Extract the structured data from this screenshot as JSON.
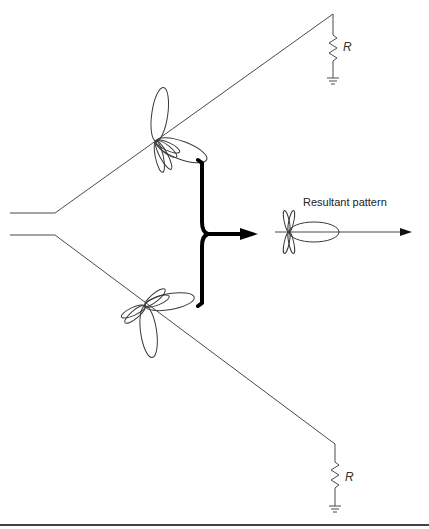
{
  "diagram": {
    "type": "V-antenna radiation pattern diagram",
    "labels": {
      "resultant": "Resultant pattern",
      "upper_resistor": "R",
      "lower_resistor": "R"
    },
    "elements": [
      {
        "id": "feed-line-upper",
        "kind": "wire"
      },
      {
        "id": "feed-line-lower",
        "kind": "wire"
      },
      {
        "id": "upper-leg",
        "kind": "wire",
        "terminated_by": "R"
      },
      {
        "id": "lower-leg",
        "kind": "wire",
        "terminated_by": "R"
      },
      {
        "id": "upper-leg-pattern",
        "kind": "radiation-lobes"
      },
      {
        "id": "lower-leg-pattern",
        "kind": "radiation-lobes"
      },
      {
        "id": "combine-brace",
        "kind": "brace-arrow"
      },
      {
        "id": "resultant-pattern",
        "kind": "radiation-lobes"
      },
      {
        "id": "direction-arrow",
        "kind": "arrow"
      }
    ],
    "colors": {
      "line": "#4a4a4a",
      "brace": "#000000",
      "background": "#ffffff"
    }
  }
}
